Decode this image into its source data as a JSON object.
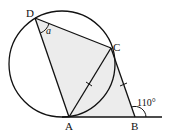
{
  "diagram": {
    "type": "geometry",
    "points": {
      "D": {
        "label": "D",
        "x": 35,
        "y": 18
      },
      "C": {
        "label": "C",
        "x": 111,
        "y": 48
      },
      "A": {
        "label": "A",
        "x": 69,
        "y": 117
      },
      "B": {
        "label": "B",
        "x": 135,
        "y": 117
      }
    },
    "circle": {
      "cx": 62,
      "cy": 64,
      "r": 53
    },
    "tangent_line": {
      "x1": 62,
      "y1": 117,
      "x2": 162,
      "y2": 117
    },
    "angles": {
      "angle_D": {
        "label": "a",
        "at": "D"
      },
      "exterior_B": {
        "label": "110°",
        "at": "B"
      }
    },
    "equal_marks": [
      "AC",
      "CB"
    ],
    "colors": {
      "stroke": "#111111",
      "shade": "#ececec",
      "background": "#ffffff"
    }
  }
}
